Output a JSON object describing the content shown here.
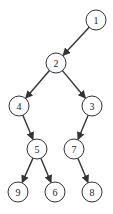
{
  "diagram": {
    "type": "binary-tree",
    "node_radius": 10,
    "colors": {
      "stroke": "#333333",
      "fill": "#ffffff",
      "text": "#222222"
    },
    "nodes": [
      {
        "id": "1",
        "label": "1",
        "x": 96,
        "y": 20
      },
      {
        "id": "2",
        "label": "2",
        "x": 56,
        "y": 63
      },
      {
        "id": "4",
        "label": "4",
        "x": 19,
        "y": 106
      },
      {
        "id": "3",
        "label": "3",
        "x": 92,
        "y": 106
      },
      {
        "id": "5",
        "label": "5",
        "x": 37,
        "y": 149
      },
      {
        "id": "7",
        "label": "7",
        "x": 74,
        "y": 149
      },
      {
        "id": "9",
        "label": "9",
        "x": 18,
        "y": 192
      },
      {
        "id": "6",
        "label": "6",
        "x": 55,
        "y": 192
      },
      {
        "id": "8",
        "label": "8",
        "x": 92,
        "y": 192
      }
    ],
    "edges": [
      {
        "from": "1",
        "to": "2"
      },
      {
        "from": "2",
        "to": "4"
      },
      {
        "from": "2",
        "to": "3"
      },
      {
        "from": "4",
        "to": "5"
      },
      {
        "from": "3",
        "to": "7"
      },
      {
        "from": "5",
        "to": "9"
      },
      {
        "from": "5",
        "to": "6"
      },
      {
        "from": "7",
        "to": "8"
      }
    ]
  }
}
